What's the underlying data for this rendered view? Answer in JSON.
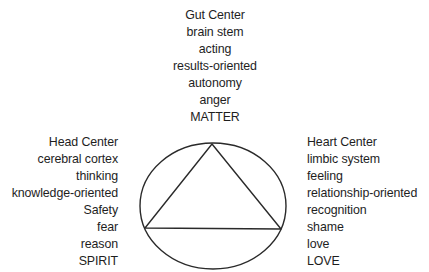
{
  "diagram": {
    "shape": {
      "ellipse": {
        "cx": 213,
        "cy": 206,
        "rx": 73,
        "ry": 63
      },
      "triangle": {
        "top": [
          212,
          144
        ],
        "left": [
          145,
          228
        ],
        "right": [
          281,
          229
        ]
      },
      "stroke_color": "#2a2a2a"
    },
    "gut_center": {
      "lines": [
        "Gut Center",
        "brain stem",
        "acting",
        "results-oriented",
        "autonomy",
        "anger",
        "MATTER"
      ]
    },
    "head_center": {
      "lines": [
        "Head Center",
        "cerebral cortex",
        "thinking",
        "knowledge-oriented",
        "Safety",
        "fear",
        "reason",
        "SPIRIT"
      ]
    },
    "heart_center": {
      "lines": [
        "Heart Center",
        "limbic system",
        "feeling",
        "relationship-oriented",
        "recognition",
        "shame",
        "love",
        "LOVE"
      ]
    }
  }
}
